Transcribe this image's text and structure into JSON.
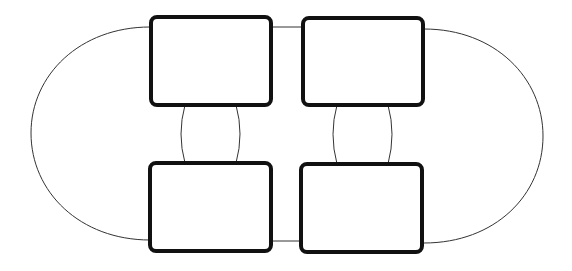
{
  "diagram": {
    "type": "box-connector-diagram",
    "background": "#ffffff",
    "box_stroke_color": "#111111",
    "connector_stroke_color": "#333333",
    "boxes": [
      {
        "id": "top-left",
        "x": 151,
        "y": 17,
        "w": 120,
        "h": 88,
        "label": ""
      },
      {
        "id": "top-right",
        "x": 303,
        "y": 18,
        "w": 120,
        "h": 87,
        "label": ""
      },
      {
        "id": "bottom-left",
        "x": 150,
        "y": 163,
        "w": 121,
        "h": 88,
        "label": ""
      },
      {
        "id": "bottom-right",
        "x": 301,
        "y": 164,
        "w": 121,
        "h": 88,
        "label": ""
      }
    ],
    "connectors": [
      {
        "id": "top-left-to-top-right",
        "from": "top-left",
        "to": "top-right",
        "shape": "straight"
      },
      {
        "id": "bottom-left-to-bottom-right",
        "from": "bottom-left",
        "to": "bottom-right",
        "shape": "straight"
      },
      {
        "id": "top-left-to-bottom-left-a",
        "from": "top-left",
        "to": "bottom-left",
        "shape": "curved"
      },
      {
        "id": "top-left-to-bottom-left-b",
        "from": "top-left",
        "to": "bottom-left",
        "shape": "curved"
      },
      {
        "id": "top-right-to-bottom-right-a",
        "from": "top-right",
        "to": "bottom-right",
        "shape": "curved"
      },
      {
        "id": "top-right-to-bottom-right-b",
        "from": "top-right",
        "to": "bottom-right",
        "shape": "curved"
      },
      {
        "id": "left-outer-arc",
        "from": "top-left",
        "to": "bottom-left",
        "shape": "arc"
      },
      {
        "id": "right-outer-arc",
        "from": "top-right",
        "to": "bottom-right",
        "shape": "arc"
      }
    ]
  }
}
